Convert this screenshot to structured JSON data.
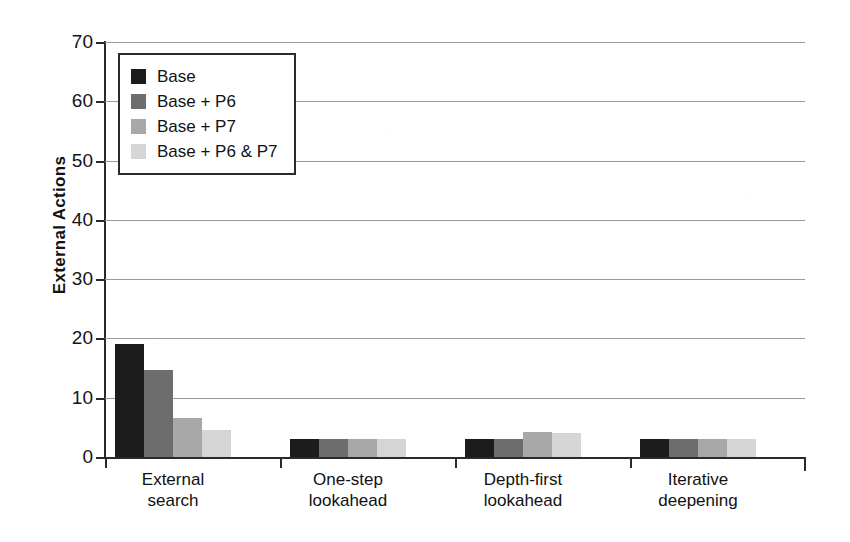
{
  "chart_data": {
    "type": "bar",
    "title": "",
    "xlabel": "",
    "ylabel": "External Actions",
    "ylim": [
      0,
      70
    ],
    "ytick_step": 10,
    "yticks": [
      0,
      10,
      20,
      30,
      40,
      50,
      60,
      70
    ],
    "grid": true,
    "grid_axis": "y",
    "legend_position": "upper-left-inside",
    "categories": [
      "External\nsearch",
      "One-step\nlookahead",
      "Depth-first\nlookahead",
      "Iterative\ndeepening"
    ],
    "category_lines": [
      [
        "External",
        "search"
      ],
      [
        "One-step",
        "lookahead"
      ],
      [
        "Depth-first",
        "lookahead"
      ],
      [
        "Iterative",
        "deepening"
      ]
    ],
    "series": [
      {
        "name": "Base",
        "color": "#1c1c1c",
        "values": [
          19.0,
          3.0,
          3.1,
          3.0
        ]
      },
      {
        "name": "Base + P6",
        "color": "#6d6d6d",
        "values": [
          14.7,
          3.0,
          3.0,
          3.0
        ]
      },
      {
        "name": "Base + P7",
        "color": "#a8a8a8",
        "values": [
          6.6,
          3.0,
          4.3,
          3.0
        ]
      },
      {
        "name": "Base + P6 & P7",
        "color": "#d5d5d5",
        "values": [
          4.6,
          3.1,
          4.0,
          3.1
        ]
      }
    ]
  },
  "legend": {
    "entries": [
      {
        "label": "Base",
        "color": "#1c1c1c"
      },
      {
        "label": "Base + P6",
        "color": "#6d6d6d"
      },
      {
        "label": "Base + P7",
        "color": "#a8a8a8"
      },
      {
        "label": "Base + P6 & P7",
        "color": "#d5d5d5"
      }
    ]
  },
  "axes": {
    "y_title": "External Actions",
    "y_tick_labels": [
      "70",
      "60",
      "50",
      "40",
      "30",
      "20",
      "10",
      "0"
    ],
    "x_tick_labels": [
      "External search",
      "One-step lookahead",
      "Depth-first lookahead",
      "Iterative deepening"
    ]
  },
  "colors": {
    "axis": "#2a2a2a",
    "grid": "#9a9a9a",
    "background": "#ffffff",
    "text": "#121212"
  }
}
